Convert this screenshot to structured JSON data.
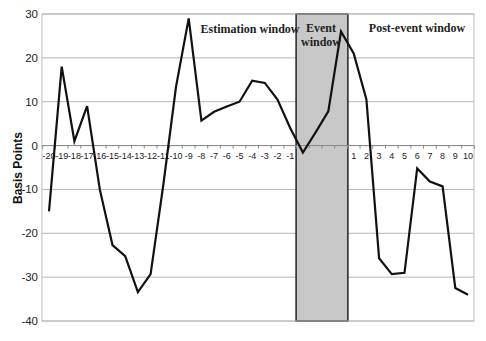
{
  "chart_data": {
    "type": "line",
    "title": "",
    "xlabel": "",
    "ylabel": "Basis Points",
    "ylim": [
      -40,
      30
    ],
    "yticks": [
      30,
      20,
      10,
      0,
      -10,
      -20,
      -30,
      -40
    ],
    "grid": true,
    "legend": "none",
    "categories": [
      "-20",
      "-19",
      "-18",
      "-17",
      "-16",
      "-15",
      "-14",
      "-13",
      "-12",
      "-11",
      "-10",
      "-9",
      "-8",
      "-7",
      "-6",
      "-5",
      "-4",
      "-3",
      "-2",
      "-1",
      "",
      "",
      "",
      "",
      "1",
      "2",
      "3",
      "4",
      "5",
      "6",
      "7",
      "8",
      "9",
      "10"
    ],
    "series": [
      {
        "name": "Abnormal return",
        "values": [
          -15,
          18,
          1,
          9,
          -10,
          -22.7,
          -25.2,
          -33.4,
          -29.3,
          -9,
          13.4,
          29,
          5.7,
          7.7,
          8.9,
          10,
          14.8,
          14.3,
          10.5,
          4,
          -1.6,
          3,
          7.8,
          26,
          21,
          10.5,
          -25.7,
          -29.3,
          -29,
          -5.2,
          -8.2,
          -9.3,
          -32.5,
          -34
        ]
      }
    ],
    "shaded_region": {
      "label_line1": "Event",
      "label_line2": "window",
      "start_index": 20,
      "end_index": 23,
      "color": "#c8c8c8"
    },
    "annotations": [
      {
        "text": "Estimation window"
      },
      {
        "text": "Post-event window"
      }
    ]
  }
}
